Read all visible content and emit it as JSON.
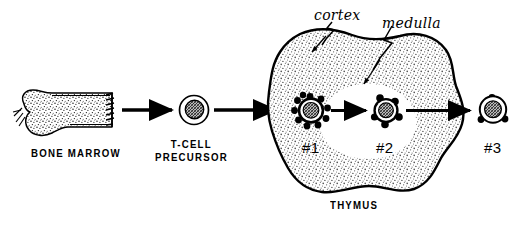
{
  "figure": {
    "background_color": "#ffffff",
    "ink_color": "#000000",
    "stipple_color": "#6b6b6b"
  },
  "stages": [
    {
      "id": "bone-marrow",
      "label": "BONE MARROW",
      "icon": "long-bone-with-marrow-icon"
    },
    {
      "id": "t-cell-precursor",
      "label_line1": "T-CELL",
      "label_line2": "PRECURSOR",
      "icon": "precursor-cell-icon"
    },
    {
      "id": "cell-1",
      "label": "#1",
      "icon": "spiky-thymocyte-icon",
      "location": "cortex"
    },
    {
      "id": "cell-2",
      "label": "#2",
      "icon": "knobbed-thymocyte-icon",
      "location": "medulla"
    },
    {
      "id": "cell-3",
      "label": "#3",
      "icon": "mature-t-cell-icon",
      "location": "periphery"
    }
  ],
  "organ": {
    "name": "THYMUS",
    "label": "THYMUS",
    "regions": [
      {
        "id": "cortex",
        "label": "cortex",
        "fill": "stippled"
      },
      {
        "id": "medulla",
        "label": "medulla",
        "fill": "white"
      }
    ]
  },
  "arrows": [
    {
      "id": "arrow-marrow-to-precursor",
      "from": "bone-marrow",
      "to": "t-cell-precursor"
    },
    {
      "id": "arrow-precursor-to-cell1",
      "from": "t-cell-precursor",
      "to": "cell-1"
    },
    {
      "id": "arrow-cell1-to-cell2",
      "from": "cell-1",
      "to": "cell-2"
    },
    {
      "id": "arrow-cell2-to-cell3",
      "from": "cell-2",
      "to": "cell-3"
    }
  ],
  "leaders": [
    {
      "id": "leader-cortex",
      "target": "cortex",
      "style": "zigzag-arrow"
    },
    {
      "id": "leader-medulla",
      "target": "medulla",
      "style": "zigzag-arrow"
    }
  ]
}
